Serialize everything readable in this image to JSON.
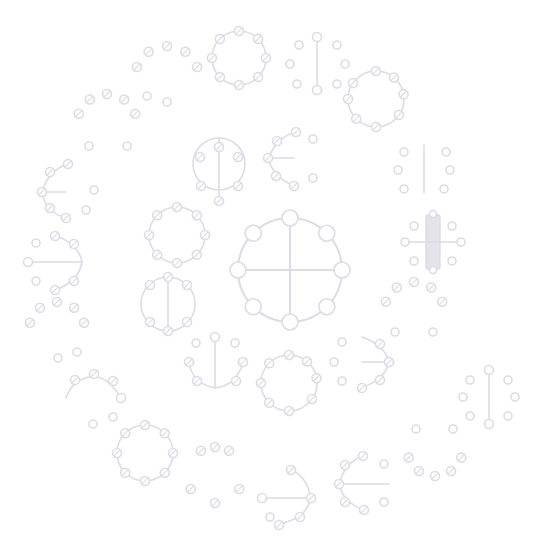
{
  "colors": {
    "background": "#ffffff",
    "stroke": "#dcdce6",
    "fill_bar": "#e3e3ea"
  },
  "glyphs": [
    {
      "name": "glyph-center-cross-ring",
      "kind": "ring-cross"
    },
    {
      "name": "glyph-right-bar-crossed",
      "kind": "bar-cross"
    },
    {
      "name": "glyph-right-dots-line",
      "kind": "dots-line-v"
    },
    {
      "name": "glyph-top-right-ring",
      "kind": "ring"
    },
    {
      "name": "glyph-top-dots-line",
      "kind": "dots-line-v"
    },
    {
      "name": "glyph-top-ring",
      "kind": "ring"
    },
    {
      "name": "glyph-top-arc",
      "kind": "arc-up"
    },
    {
      "name": "glyph-upper-left-arc",
      "kind": "arc-up"
    },
    {
      "name": "glyph-left-c-line",
      "kind": "c-line"
    },
    {
      "name": "glyph-left-reverse-c-line",
      "kind": "rc-line"
    },
    {
      "name": "glyph-lower-left-arc",
      "kind": "arc-up"
    },
    {
      "name": "glyph-bottom-left-arc",
      "kind": "arc-up"
    },
    {
      "name": "glyph-bottom-left-ring",
      "kind": "ring"
    },
    {
      "name": "glyph-bottom-ring-open",
      "kind": "ring"
    },
    {
      "name": "glyph-bottom-reverse-c-line",
      "kind": "rc-line"
    },
    {
      "name": "glyph-bottom-c-line",
      "kind": "c-line"
    },
    {
      "name": "glyph-bottom-right-arc",
      "kind": "arc-down"
    },
    {
      "name": "glyph-far-right-dots-line",
      "kind": "dots-line-v"
    },
    {
      "name": "glyph-inner-ring-top-left",
      "kind": "ring-vline"
    },
    {
      "name": "glyph-inner-c-line-top",
      "kind": "c-line"
    },
    {
      "name": "glyph-inner-ring-left",
      "kind": "ring"
    },
    {
      "name": "glyph-inner-ring-left-vline",
      "kind": "ring-vline"
    },
    {
      "name": "glyph-inner-u-line",
      "kind": "u-line"
    },
    {
      "name": "glyph-inner-ring-bottom",
      "kind": "ring"
    },
    {
      "name": "glyph-inner-reverse-c-line",
      "kind": "rc-line"
    },
    {
      "name": "glyph-inner-arc-right",
      "kind": "arc-up"
    }
  ]
}
